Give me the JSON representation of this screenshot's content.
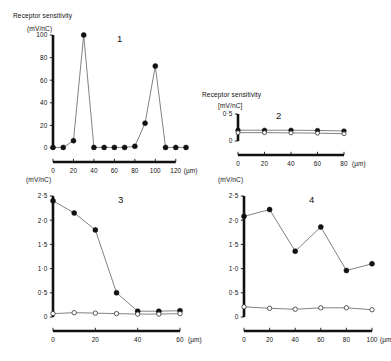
{
  "figure": {
    "background": "#ffffff",
    "ink": "#111111",
    "line_color": "#4a4a4a"
  },
  "chart_data": [
    {
      "type": "line",
      "panel_label": "1",
      "title": "Receptor sensitivity",
      "ylabel": "(mV/nC)",
      "xlabel": "(µm)",
      "xlim": [
        0,
        130
      ],
      "ylim": [
        0,
        100
      ],
      "xticks": [
        0,
        20,
        40,
        60,
        80,
        100,
        120
      ],
      "xtick_labels": [
        "0",
        "20",
        "40",
        "60",
        "80",
        "100",
        "120"
      ],
      "yticks": [
        0,
        20,
        40,
        60,
        80,
        100
      ],
      "ytick_labels": [
        "0",
        "20",
        "40",
        "60",
        "80",
        "100"
      ],
      "grid": false,
      "legend": "none",
      "series": [
        {
          "name": "filled",
          "marker": "filled-circle",
          "x": [
            0,
            10,
            20,
            30,
            40,
            50,
            60,
            70,
            80,
            90,
            100,
            110,
            120,
            130
          ],
          "values": [
            0.5,
            0.5,
            6.5,
            100,
            0.5,
            0.5,
            0.5,
            0.5,
            1.5,
            22,
            72.5,
            0.5,
            0.5,
            0.5
          ]
        }
      ]
    },
    {
      "type": "line",
      "panel_label": "2",
      "title": "Receptor sensitivity",
      "ylabel": "[mV/nC]",
      "xlabel": "(µm)",
      "xlim": [
        0,
        80
      ],
      "ylim": [
        0,
        0.5
      ],
      "xticks": [
        0,
        20,
        40,
        60,
        80
      ],
      "xtick_labels": [
        "0",
        "20",
        "40",
        "60",
        "80"
      ],
      "yticks": [
        0,
        0.5
      ],
      "ytick_labels": [
        "0",
        "0·5"
      ],
      "grid": false,
      "legend": "none",
      "series": [
        {
          "name": "filled",
          "marker": "filled-circle",
          "x": [
            0,
            20,
            40,
            60,
            80
          ],
          "values": [
            0.2,
            0.2,
            0.2,
            0.195,
            0.185
          ]
        },
        {
          "name": "open",
          "marker": "open-circle",
          "x": [
            0,
            20,
            40,
            60,
            80
          ],
          "values": [
            0.155,
            0.155,
            0.15,
            0.145,
            0.135
          ]
        }
      ]
    },
    {
      "type": "line",
      "panel_label": "3",
      "title": "",
      "ylabel": "(mV/nC)",
      "xlabel": "(µm)",
      "xlim": [
        0,
        60
      ],
      "ylim": [
        0,
        2.5
      ],
      "xticks": [
        0,
        20,
        40,
        60
      ],
      "xtick_labels": [
        "0",
        "20",
        "40",
        "60"
      ],
      "yticks": [
        0,
        0.5,
        1.0,
        1.5,
        2.0,
        2.5
      ],
      "ytick_labels": [
        "0",
        "0·5",
        "1·0",
        "1·5",
        "2·0",
        "2·5"
      ],
      "grid": false,
      "legend": "none",
      "series": [
        {
          "name": "filled",
          "marker": "filled-circle",
          "x": [
            0,
            10,
            20,
            30,
            40,
            50,
            60
          ],
          "values": [
            2.4,
            2.15,
            1.8,
            0.5,
            0.12,
            0.12,
            0.13
          ]
        },
        {
          "name": "open",
          "marker": "open-circle",
          "x": [
            0,
            10,
            20,
            30,
            40,
            50,
            60
          ],
          "values": [
            0.07,
            0.09,
            0.08,
            0.07,
            0.06,
            0.06,
            0.07
          ]
        }
      ]
    },
    {
      "type": "line",
      "panel_label": "4",
      "title": "",
      "ylabel": "(mV/nC)",
      "xlabel": "(µm)",
      "xlim": [
        0,
        100
      ],
      "ylim": [
        0,
        2.5
      ],
      "xticks": [
        0,
        20,
        40,
        60,
        80,
        100
      ],
      "xtick_labels": [
        "0",
        "20",
        "40",
        "60",
        "80",
        "100"
      ],
      "yticks": [
        0,
        0.5,
        1.0,
        1.5,
        2.0,
        2.5
      ],
      "ytick_labels": [
        "0",
        "0·5",
        "1·0",
        "1·5",
        "2·0",
        "2·5"
      ],
      "grid": false,
      "legend": "none",
      "series": [
        {
          "name": "filled",
          "marker": "filled-circle",
          "x": [
            0,
            20,
            40,
            60,
            80,
            100
          ],
          "values": [
            2.08,
            2.22,
            1.36,
            1.86,
            0.96,
            1.1
          ]
        },
        {
          "name": "open",
          "marker": "open-circle",
          "x": [
            0,
            20,
            40,
            60,
            80,
            100
          ],
          "values": [
            0.21,
            0.18,
            0.16,
            0.19,
            0.19,
            0.15
          ]
        }
      ]
    }
  ]
}
